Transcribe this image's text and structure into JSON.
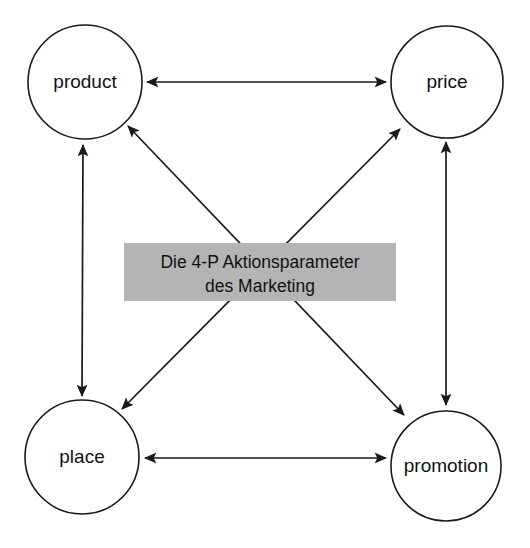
{
  "diagram": {
    "title_box": {
      "line1": "Die 4-P Aktionsparameter",
      "line2": "des Marketing",
      "background_color": "#b4b4b4",
      "text_color": "#111111"
    },
    "nodes": [
      {
        "id": "product",
        "label": "product",
        "cx": 85,
        "cy": 82,
        "r": 57
      },
      {
        "id": "price",
        "label": "price",
        "cx": 447,
        "cy": 82,
        "r": 56
      },
      {
        "id": "place",
        "label": "place",
        "cx": 82,
        "cy": 457,
        "r": 57
      },
      {
        "id": "promotion",
        "label": "promotion",
        "cx": 446,
        "cy": 466,
        "r": 55
      }
    ],
    "edges": [
      {
        "id": "product-price",
        "from": "product",
        "to": "price",
        "arrows": "both",
        "kind": "horizontal"
      },
      {
        "id": "place-promotion",
        "from": "place",
        "to": "promotion",
        "arrows": "both",
        "kind": "horizontal"
      },
      {
        "id": "product-place",
        "from": "product",
        "to": "place",
        "arrows": "both",
        "kind": "vertical"
      },
      {
        "id": "price-promotion",
        "from": "price",
        "to": "promotion",
        "arrows": "both",
        "kind": "vertical"
      },
      {
        "id": "product-promotion",
        "from": "product",
        "to": "promotion",
        "arrows": "both",
        "kind": "diagonal"
      },
      {
        "id": "price-place",
        "from": "price",
        "to": "place",
        "arrows": "both",
        "kind": "diagonal"
      }
    ],
    "stroke_color": "#1a1a1a",
    "background_color": "#ffffff"
  }
}
